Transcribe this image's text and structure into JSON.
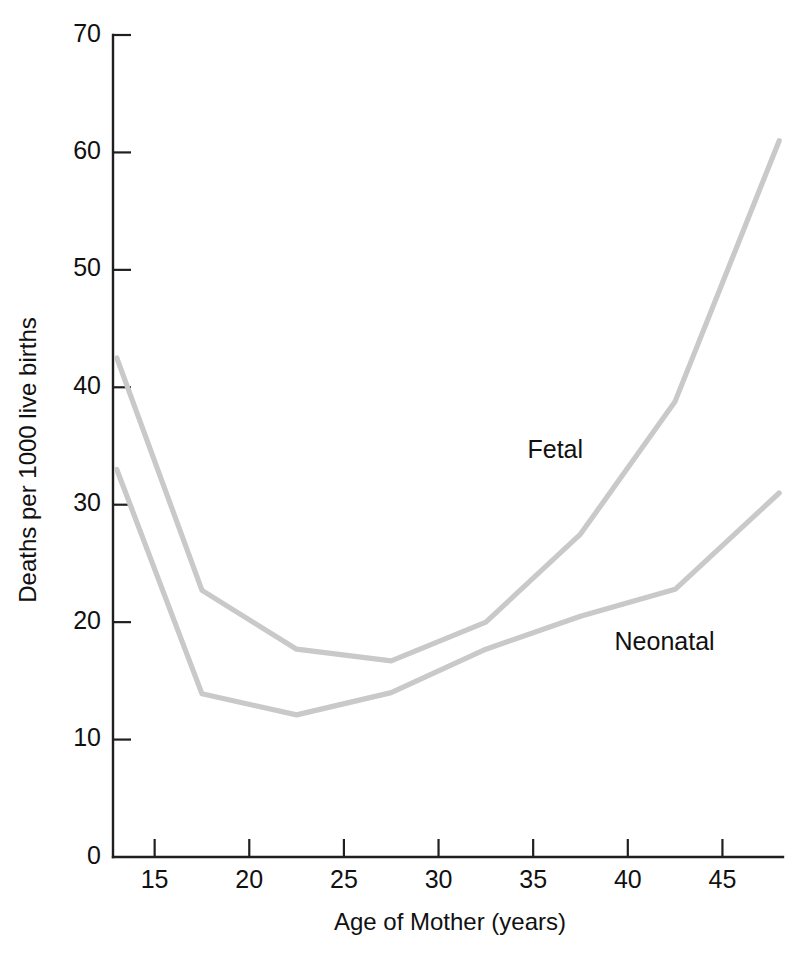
{
  "chart_data": {
    "type": "line",
    "title": "",
    "xlabel": "Age of Mother (years)",
    "ylabel": "Deaths per 1000 live births",
    "xlim": [
      12.8,
      48.2
    ],
    "ylim": [
      0,
      70
    ],
    "xticks": [
      15,
      20,
      25,
      30,
      35,
      40,
      45
    ],
    "xtick_labels": [
      "15",
      "20",
      "25",
      "30",
      "35",
      "40",
      "45"
    ],
    "yticks": [
      0,
      10,
      20,
      30,
      40,
      50,
      60,
      70
    ],
    "ytick_labels": [
      "0",
      "10",
      "20",
      "30",
      "40",
      "50",
      "60",
      "70"
    ],
    "grid": false,
    "legend": "inline-labels",
    "line_color": "#c9c9c9",
    "axis_color": "#1f1f1f",
    "x": [
      13,
      17.5,
      22.5,
      27.5,
      32.5,
      37.5,
      42.5,
      48
    ],
    "series": [
      {
        "name": "Fetal",
        "color": "#c9c9c9",
        "values": [
          42.5,
          22.7,
          17.7,
          16.7,
          20.0,
          27.5,
          38.8,
          61.0
        ],
        "label_x": 34.7,
        "label_y": 34.5
      },
      {
        "name": "Neonatal",
        "color": "#c9c9c9",
        "values": [
          33.0,
          13.9,
          12.1,
          14.0,
          17.7,
          20.5,
          22.8,
          31.0
        ],
        "label_x": 39.3,
        "label_y": 18.2
      }
    ]
  }
}
